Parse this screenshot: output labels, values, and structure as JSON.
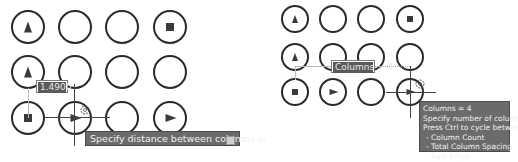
{
  "left": {
    "grid": [
      [
        "triangle-up",
        "empty",
        "empty",
        "square"
      ],
      [
        "triangle-up",
        "empty",
        "empty",
        "empty"
      ],
      [
        "square",
        "triangle-right",
        "empty",
        "triangle-right"
      ]
    ],
    "dimension_input": {
      "value": "1.4900"
    },
    "tooltip": {
      "text": "Specify distance between columns or"
    }
  },
  "right": {
    "grid": [
      [
        "triangle-up",
        "empty",
        "empty",
        "square"
      ],
      [
        "triangle-up",
        "empty",
        "empty",
        "empty"
      ],
      [
        "square",
        "triangle-right",
        "empty",
        "triangle-right"
      ]
    ],
    "dimension_input": {
      "value": "Columns = 4"
    },
    "tooltip": {
      "lines": [
        "Columns = 4",
        "Specify number of columns:",
        "Press Ctrl to cycle between:",
        "- Column Count",
        "- Total Column Spacing",
        "- Axis Angle"
      ]
    }
  },
  "colors": {
    "stroke": "#2a2a2a",
    "tooltip_bg": "#6b6b6b",
    "tooltip_text": "#f0f0f0",
    "input_selection_bg": "#5a5a5a"
  }
}
